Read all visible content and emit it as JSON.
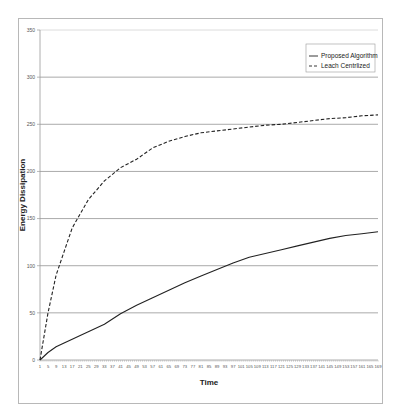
{
  "chart_data": {
    "type": "line",
    "title": "",
    "xlabel": "Time",
    "ylabel": "Energy Dissipation",
    "ylim": [
      0,
      350
    ],
    "yticks": [
      0,
      50,
      100,
      150,
      200,
      250,
      300,
      350
    ],
    "xlim": [
      1,
      169
    ],
    "xtick_labels": [
      1,
      5,
      9,
      13,
      17,
      21,
      25,
      29,
      33,
      37,
      41,
      45,
      49,
      53,
      57,
      61,
      65,
      69,
      73,
      77,
      81,
      85,
      89,
      93,
      97,
      101,
      105,
      109,
      113,
      117,
      121,
      125,
      129,
      133,
      137,
      141,
      145,
      149,
      153,
      157,
      161,
      165,
      169
    ],
    "grid": "horizontal",
    "legend_position": "upper right",
    "x": [
      1,
      5,
      9,
      13,
      17,
      21,
      25,
      33,
      41,
      49,
      57,
      65,
      73,
      81,
      89,
      97,
      105,
      113,
      121,
      129,
      137,
      145,
      153,
      161,
      169
    ],
    "series": [
      {
        "name": "Proposed Algorithm",
        "style": "solid",
        "color": "#222222",
        "values": [
          0,
          8,
          14,
          18,
          22,
          26,
          30,
          38,
          49,
          58,
          66,
          74,
          82,
          89,
          96,
          103,
          109,
          113,
          117,
          121,
          125,
          129,
          132,
          134,
          136
        ]
      },
      {
        "name": "Leach Centrlized",
        "style": "dashed",
        "color": "#222222",
        "values": [
          0,
          50,
          90,
          115,
          140,
          155,
          170,
          190,
          204,
          213,
          225,
          232,
          237,
          241,
          243,
          245,
          247,
          249,
          250,
          252,
          254,
          256,
          257,
          259,
          260
        ]
      }
    ]
  },
  "legend": {
    "items": [
      {
        "label": "Proposed Algorithm",
        "style": "solid"
      },
      {
        "label": "Leach Centrlized",
        "style": "dashed"
      }
    ]
  },
  "axes": {
    "x_title": "Time",
    "y_title": "Energy Dissipation"
  },
  "colors": {
    "gridline": "#a0a0a0",
    "line": "#222222",
    "frame": "#b8b8b8"
  }
}
